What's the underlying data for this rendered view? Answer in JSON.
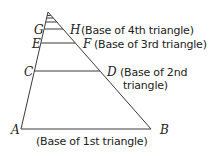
{
  "diagram": {
    "points": {
      "A": "A",
      "B": "B",
      "C": "C",
      "D": "D",
      "E": "E",
      "F": "F",
      "G": "G",
      "H": "H"
    },
    "labels": {
      "base4": "(Base of 4th triangle)",
      "base3": "(Base of 3rd triangle)",
      "base2_line1": "(Base of 2nd",
      "base2_line2": "triangle)",
      "base1": "(Base of 1st triangle)"
    },
    "stroke_color": "#333333"
  }
}
